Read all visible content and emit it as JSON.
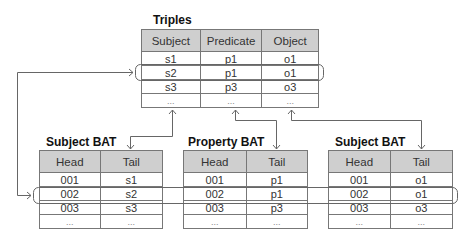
{
  "triples": {
    "title": "Triples",
    "headers": [
      "Subject",
      "Predicate",
      "Object"
    ],
    "rows": [
      [
        "s1",
        "p1",
        "o1"
      ],
      [
        "s2",
        "p1",
        "o1"
      ],
      [
        "s3",
        "p3",
        "o3"
      ],
      [
        "...",
        "...",
        "..."
      ]
    ]
  },
  "subject_bat": {
    "title": "Subject BAT",
    "headers": [
      "Head",
      "Tail"
    ],
    "rows": [
      [
        "001",
        "s1"
      ],
      [
        "002",
        "s2"
      ],
      [
        "003",
        "s3"
      ],
      [
        "...",
        "..."
      ]
    ]
  },
  "property_bat": {
    "title": "Property BAT",
    "headers": [
      "Head",
      "Tail"
    ],
    "rows": [
      [
        "001",
        "p1"
      ],
      [
        "002",
        "p1"
      ],
      [
        "003",
        "p3"
      ],
      [
        "...",
        "..."
      ]
    ]
  },
  "object_bat": {
    "title": "Subject BAT",
    "headers": [
      "Head",
      "Tail"
    ],
    "rows": [
      [
        "001",
        "o1"
      ],
      [
        "002",
        "o1"
      ],
      [
        "003",
        "o3"
      ],
      [
        "...",
        "..."
      ]
    ]
  },
  "colors": {
    "header_fill": "#cfcfcf",
    "line": "#666666"
  }
}
